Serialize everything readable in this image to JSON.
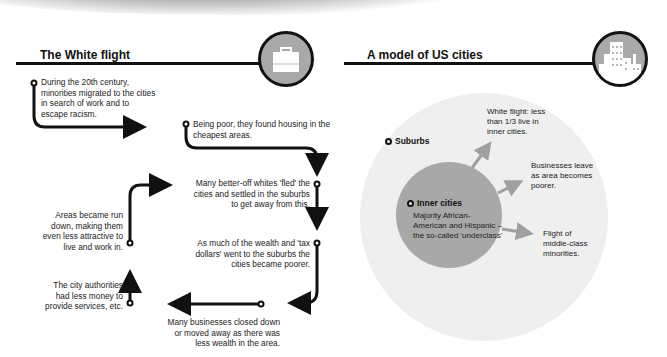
{
  "left_panel": {
    "title": "The White flight",
    "icon": "briefcase-icon",
    "steps": [
      {
        "id": 1,
        "text": "During the 20th century, minorities migrated to the cities in search of work and to escape racism."
      },
      {
        "id": 2,
        "text": "Being poor, they found housing in the cheapest areas."
      },
      {
        "id": 3,
        "text": "Many better-off whites 'fled' the cities and settled in the suburbs to get away from this."
      },
      {
        "id": 4,
        "text": "As much of the wealth and 'tax dollars' went to the suburbs the cities became poorer."
      },
      {
        "id": 5,
        "text": "Many businesses closed down or moved away as there was less wealth in the area."
      },
      {
        "id": 6,
        "text": "The city authorities had less money to provide services, etc."
      },
      {
        "id": 7,
        "text": "Areas became run down, making them even less attractive to live and work in."
      }
    ]
  },
  "right_panel": {
    "title": "A model of US cities",
    "icon": "city-buildings-icon",
    "outer_label": "Suburbs",
    "inner_label": "Inner cities",
    "inner_text": "Majority African-American and Hispanic – the so-called 'underclass'",
    "outflows": [
      {
        "text": "White flight: less than 1/3 live in inner cities."
      },
      {
        "text": "Businesses leave as area becomes poorer."
      },
      {
        "text": "Flight of middle-class minorities."
      }
    ]
  },
  "colors": {
    "line": "#111111",
    "icon_bg": "#a9a9a9",
    "outer_circle": "#efefef",
    "inner_circle": "#a8a8a8",
    "outflow_arrow": "#a0a0a0"
  }
}
